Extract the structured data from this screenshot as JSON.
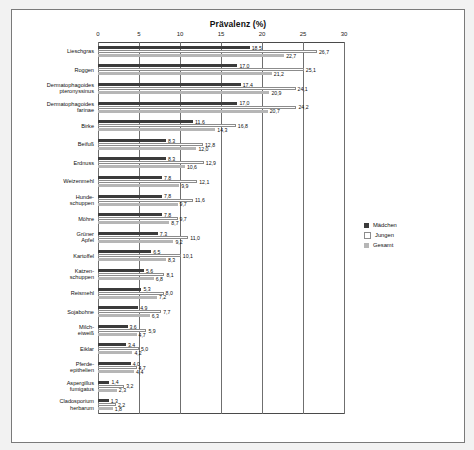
{
  "chart_data": {
    "type": "bar",
    "title": "Prävalenz (%)",
    "xlabel": "",
    "ylabel": "",
    "orientation": "horizontal",
    "xlim": [
      0,
      30
    ],
    "xticks": [
      0,
      5,
      10,
      15,
      20,
      25,
      30
    ],
    "grid": true,
    "legend_position": "right",
    "categories": [
      "Lieschgras",
      "Roggen",
      "Dermatophagoides\npteronyssinus",
      "Dermatophagoides\nfarinae",
      "Birke",
      "Beifuß",
      "Erdnuss",
      "Weizenmehl",
      "Hunde-\nschuppen",
      "Möhre",
      "Grüner\nApfel",
      "Kartoffel",
      "Katzen-\nschuppen",
      "Reismehl",
      "Sojabohne",
      "Milch-\neiweiß",
      "Eiklar",
      "Pferde-\nepithelien",
      "Aspergillus\nfumigatus",
      "Cladosporium\nherbarum"
    ],
    "series": [
      {
        "name": "Mädchen",
        "color": "#3b3b3b",
        "values": [
          18.5,
          17.0,
          17.4,
          17.0,
          11.6,
          8.3,
          8.3,
          7.8,
          7.8,
          7.8,
          7.3,
          6.5,
          5.6,
          5.3,
          4.9,
          3.6,
          3.4,
          4.0,
          1.4,
          1.3
        ]
      },
      {
        "name": "Jungen",
        "color": "#ffffff",
        "values": [
          26.7,
          25.1,
          24.1,
          24.2,
          16.8,
          12.8,
          12.9,
          12.1,
          11.6,
          9.7,
          11.0,
          10.1,
          8.1,
          8.0,
          7.7,
          5.9,
          5.0,
          4.7,
          3.2,
          2.2
        ]
      },
      {
        "name": "Gesamt",
        "color": "#b6b6b6",
        "values": [
          22.7,
          21.2,
          20.9,
          20.7,
          14.3,
          12.0,
          10.6,
          9.9,
          9.7,
          8.7,
          9.2,
          8.3,
          6.8,
          7.2,
          6.3,
          4.7,
          4.2,
          4.4,
          2.3,
          1.8
        ]
      }
    ]
  },
  "legend": {
    "items": [
      {
        "label": "Mädchen"
      },
      {
        "label": "Jungen"
      },
      {
        "label": "Gesamt"
      }
    ]
  }
}
